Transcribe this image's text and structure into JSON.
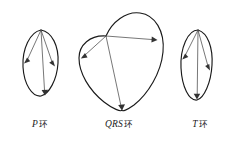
{
  "figure": {
    "name": "vectorcardiogram-loops",
    "background_color": "#ffffff",
    "outline_color": "#1a1a1a",
    "vector_color": "#4a4a4a",
    "width": 229,
    "height": 150
  },
  "loops": [
    {
      "id": "p-loop",
      "label_italic": "P",
      "label_cjk": "环",
      "caption": "P环",
      "shape": "narrow-tilted-ellipse",
      "origin_point": [
        41,
        30
      ],
      "vectors": [
        {
          "name": "left-vector",
          "from": [
            41,
            30
          ],
          "to": [
            24,
            63
          ]
        },
        {
          "name": "right-vector",
          "from": [
            41,
            30
          ],
          "to": [
            55,
            66
          ]
        },
        {
          "name": "bottom-vector",
          "from": [
            41,
            30
          ],
          "to": [
            45,
            95
          ]
        }
      ]
    },
    {
      "id": "qrs-loop",
      "label_italic": "QRS",
      "label_cjk": "环",
      "caption": "QRS环",
      "shape": "large-rounded-heart-loop",
      "origin_point": [
        106,
        36
      ],
      "vectors": [
        {
          "name": "left-vector",
          "from": [
            106,
            36
          ],
          "to": [
            81,
            58
          ]
        },
        {
          "name": "right-vector",
          "from": [
            106,
            36
          ],
          "to": [
            157,
            40
          ]
        },
        {
          "name": "bottom-vector",
          "from": [
            106,
            36
          ],
          "to": [
            122,
            110
          ]
        }
      ]
    },
    {
      "id": "t-loop",
      "label_italic": "T",
      "label_cjk": "环",
      "caption": "T环",
      "shape": "narrow-tilted-ellipse",
      "origin_point": [
        198,
        30
      ],
      "vectors": [
        {
          "name": "left-vector",
          "from": [
            198,
            30
          ],
          "to": [
            182,
            59
          ]
        },
        {
          "name": "right-vector",
          "from": [
            198,
            30
          ],
          "to": [
            210,
            70
          ]
        },
        {
          "name": "bottom-vector",
          "from": [
            198,
            30
          ],
          "to": [
            197,
            99
          ]
        }
      ]
    }
  ]
}
